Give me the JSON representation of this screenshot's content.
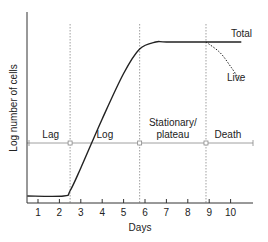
{
  "chart_data": {
    "type": "line",
    "title": "",
    "xlabel": "Days",
    "ylabel": "Log number of cells",
    "x_ticks": [
      1,
      2,
      3,
      4,
      5,
      6,
      7,
      8,
      9,
      10
    ],
    "xlim": [
      0.5,
      11.0
    ],
    "ylim": [
      0,
      1
    ],
    "grid": false,
    "phase_boundaries_days": [
      2.5,
      5.75,
      8.85
    ],
    "phases": [
      {
        "name": "Lag",
        "label": "Lag"
      },
      {
        "name": "Log",
        "label": "Log"
      },
      {
        "name": "Stationary",
        "label": "Stationary/\nplateau",
        "label_lines": [
          "Stationary/",
          "plateau"
        ]
      },
      {
        "name": "Death",
        "label": "Death"
      }
    ],
    "series": [
      {
        "name": "Total",
        "label": "Total",
        "style": "solid",
        "points": [
          [
            0.5,
            0.04
          ],
          [
            2.2,
            0.04
          ],
          [
            2.5,
            0.07
          ],
          [
            3.0,
            0.2
          ],
          [
            4.0,
            0.48
          ],
          [
            5.0,
            0.74
          ],
          [
            5.75,
            0.88
          ],
          [
            6.5,
            0.92
          ],
          [
            7.0,
            0.92
          ],
          [
            8.85,
            0.92
          ],
          [
            10.5,
            0.92
          ]
        ]
      },
      {
        "name": "Live",
        "label": "Live",
        "style": "dashed",
        "points": [
          [
            8.85,
            0.92
          ],
          [
            9.5,
            0.86
          ],
          [
            10.0,
            0.78
          ],
          [
            10.5,
            0.69
          ]
        ]
      }
    ],
    "colors": {
      "curve": "#222222",
      "dashed_guides": "#888888",
      "phase_line": "#888888",
      "axis": "#333333"
    }
  }
}
